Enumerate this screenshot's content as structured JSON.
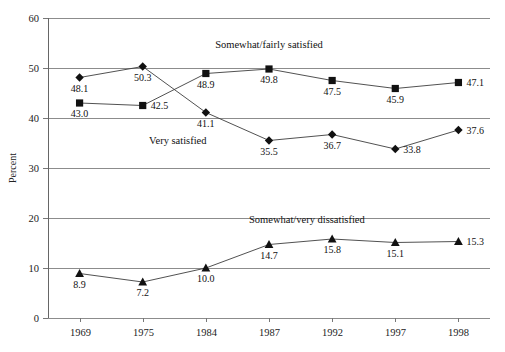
{
  "chart_data": {
    "type": "line",
    "title": "",
    "xlabel": "",
    "ylabel": "Percent",
    "categories": [
      "1969",
      "1975",
      "1984",
      "1987",
      "1992",
      "1997",
      "1998"
    ],
    "ylim": [
      0,
      60
    ],
    "yticks": [
      0,
      10,
      20,
      30,
      40,
      50,
      60
    ],
    "ytick_labels": [
      "0",
      "10",
      "20",
      "30",
      "40",
      "50",
      "60"
    ],
    "grid": true,
    "legend_position": "inline-annotations",
    "series": [
      {
        "name": "Very satisfied",
        "marker": "diamond",
        "values": [
          48.1,
          50.3,
          41.1,
          35.5,
          36.7,
          33.8,
          37.6
        ],
        "value_labels": [
          "48.1",
          "50.3",
          "41.1",
          "35.5",
          "36.7",
          "33.8",
          "37.6"
        ]
      },
      {
        "name": "Somewhat/fairly satisfied",
        "marker": "square",
        "values": [
          43.0,
          42.5,
          48.9,
          49.8,
          47.5,
          45.9,
          47.1
        ],
        "value_labels": [
          "43.0",
          "42.5",
          "48.9",
          "49.8",
          "47.5",
          "45.9",
          "47.1"
        ]
      },
      {
        "name": "Somewhat/very dissatisfied",
        "marker": "triangle",
        "values": [
          8.9,
          7.2,
          10.0,
          14.7,
          15.8,
          15.1,
          15.3
        ],
        "value_labels": [
          "8.9",
          "7.2",
          "10.0",
          "14.7",
          "15.8",
          "15.1",
          "15.3"
        ]
      }
    ],
    "annotations": [
      {
        "text": "Somewhat/fairly satisfied",
        "x": 1987,
        "y": 54.0
      },
      {
        "text": "Very satisfied",
        "x": 1980,
        "y": 34.8
      },
      {
        "text": "Somewhat/very dissatisfied",
        "x": 1990,
        "y": 19.0
      }
    ],
    "colors": {
      "marker": "#111111",
      "line": "#3d3d3d",
      "grid": "#8c8c8c",
      "axis": "#666666",
      "text": "#1a1a1a",
      "background": "#ffffff"
    }
  }
}
